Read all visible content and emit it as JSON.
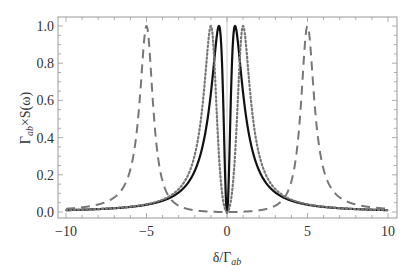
{
  "chart_data": {
    "type": "line",
    "title": "",
    "xlabel": "δ/Γ_ab",
    "ylabel": "Γ_ab×S(ω)",
    "xlim": [
      -10,
      10
    ],
    "ylim": [
      0,
      1.0
    ],
    "x_ticks": [
      "-10",
      "-5",
      "0",
      "5",
      "10"
    ],
    "y_ticks": [
      "0.0",
      "0.2",
      "0.4",
      "0.6",
      "0.8",
      "1.0"
    ],
    "grid": false,
    "legend": null,
    "series": [
      {
        "name": "solid",
        "style": "solid",
        "color": "#111111",
        "description": "double peak at δ≈±0.5, zero at δ=0",
        "peaks": [
          -0.5,
          0.5
        ],
        "peak_value": 1.0,
        "dip": {
          "x": 0,
          "y": 0
        }
      },
      {
        "name": "dotted",
        "style": "dotted",
        "color": "#777777",
        "description": "double peak at δ≈±1, zero at δ=0",
        "peaks": [
          -1.0,
          1.0
        ],
        "peak_value": 1.0,
        "dip": {
          "x": 0,
          "y": 0
        }
      },
      {
        "name": "dashed",
        "style": "dashed",
        "color": "#777777",
        "description": "double peak at δ≈±5, zero at δ=0",
        "peaks": [
          -5.0,
          5.0
        ],
        "peak_value": 1.0,
        "dip": {
          "x": 0,
          "y": 0
        }
      }
    ]
  },
  "labels": {
    "xlabel_main": "δ/Γ",
    "xlabel_sub": "ab",
    "ylabel_main": "Γ",
    "ylabel_sub": "ab",
    "ylabel_rest": "×S(ω)"
  }
}
